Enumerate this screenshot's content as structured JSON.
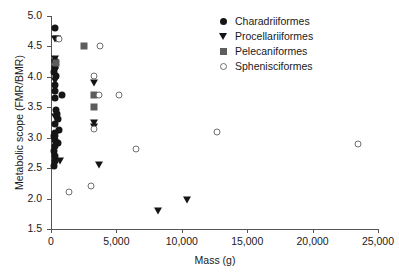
{
  "chart_data": {
    "type": "scatter",
    "title": "",
    "xlabel": "Mass (g)",
    "ylabel": "Metabolic scope (FMR/BMR)",
    "xlim": [
      0,
      25000
    ],
    "ylim": [
      1.5,
      5.0
    ],
    "xticks": [
      0,
      5000,
      10000,
      15000,
      20000,
      25000
    ],
    "xticklabels": [
      "0",
      "5,000",
      "10,000",
      "15,000",
      "20,000",
      "25,000"
    ],
    "yticks": [
      1.5,
      2.0,
      2.5,
      3.0,
      3.5,
      4.0,
      4.5,
      5.0
    ],
    "yticklabels": [
      "1.5",
      "2.0",
      "2.5",
      "3.0",
      "3.5",
      "4.0",
      "4.5",
      "5.0"
    ],
    "grid": false,
    "legend_position": "top-right",
    "series": [
      {
        "name": "Charadriiformes",
        "marker": "circle-filled",
        "color": "#151515",
        "points": [
          [
            330,
            4.8
          ],
          [
            300,
            4.26
          ],
          [
            300,
            4.16
          ],
          [
            250,
            4.08
          ],
          [
            420,
            4.02
          ],
          [
            300,
            3.86
          ],
          [
            330,
            3.76
          ],
          [
            850,
            3.71
          ],
          [
            300,
            3.66
          ],
          [
            420,
            3.46
          ],
          [
            480,
            3.39
          ],
          [
            500,
            3.3
          ],
          [
            300,
            3.22
          ],
          [
            620,
            3.12
          ],
          [
            300,
            3.08
          ],
          [
            250,
            3.02
          ],
          [
            330,
            2.96
          ],
          [
            560,
            2.92
          ],
          [
            300,
            2.86
          ],
          [
            250,
            2.78
          ],
          [
            300,
            2.7
          ],
          [
            330,
            2.62
          ],
          [
            250,
            2.54
          ]
        ]
      },
      {
        "name": "Procellariiformes",
        "marker": "triangle-filled",
        "color": "#151515",
        "points": [
          [
            280,
            4.62
          ],
          [
            480,
            4.62
          ],
          [
            330,
            4.3
          ],
          [
            330,
            4.22
          ],
          [
            330,
            4.1
          ],
          [
            300,
            3.94
          ],
          [
            3250,
            3.9
          ],
          [
            300,
            3.34
          ],
          [
            3250,
            3.25
          ],
          [
            3250,
            3.18
          ],
          [
            300,
            3.04
          ],
          [
            330,
            2.98
          ],
          [
            700,
            2.62
          ],
          [
            3700,
            2.55
          ],
          [
            8200,
            1.8
          ],
          [
            10400,
            1.98
          ]
        ]
      },
      {
        "name": "Pelecaniformes",
        "marker": "square-filled",
        "color": "#5d5d5d",
        "points": [
          [
            2500,
            4.5
          ],
          [
            400,
            4.22
          ],
          [
            3300,
            3.7
          ],
          [
            3300,
            3.5
          ]
        ]
      },
      {
        "name": "Sphenisciformes",
        "marker": "circle-open",
        "color": "#6e6e6e",
        "points": [
          [
            620,
            4.62
          ],
          [
            3750,
            4.5
          ],
          [
            3250,
            4.02
          ],
          [
            3700,
            3.7
          ],
          [
            5200,
            3.7
          ],
          [
            3300,
            3.14
          ],
          [
            6500,
            2.82
          ],
          [
            12700,
            3.1
          ],
          [
            23500,
            2.89
          ],
          [
            1400,
            2.1
          ],
          [
            3050,
            2.2
          ]
        ]
      }
    ]
  },
  "legend": {
    "items": [
      {
        "label": "Charadriiformes",
        "marker": "circle-filled"
      },
      {
        "label": "Procellariiformes",
        "marker": "triangle-filled"
      },
      {
        "label": "Pelecaniformes",
        "marker": "square-filled"
      },
      {
        "label": "Sphenisciformes",
        "marker": "circle-open"
      }
    ]
  }
}
